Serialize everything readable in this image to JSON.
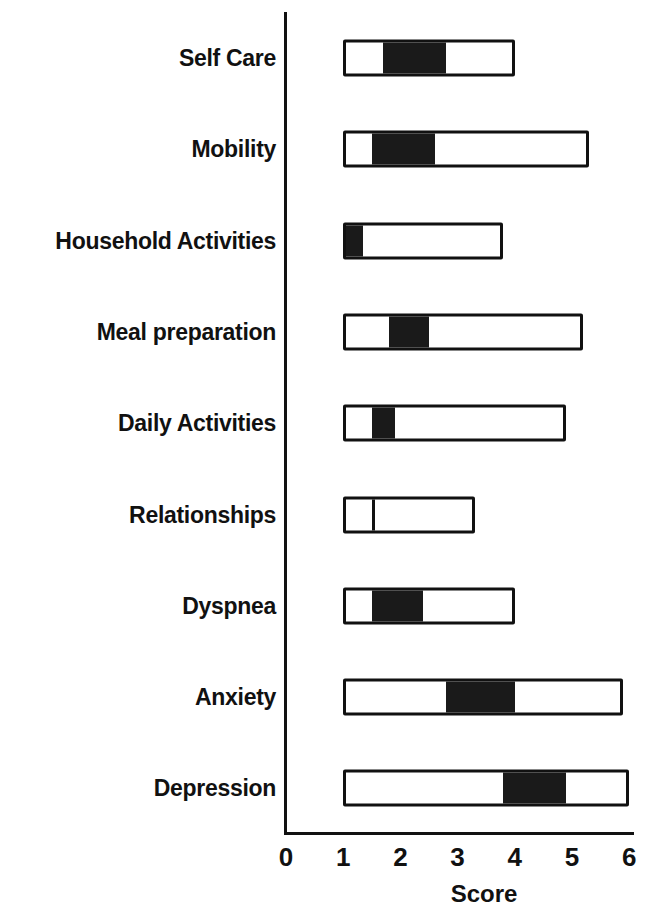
{
  "chart_data": {
    "type": "box",
    "title": "",
    "xlabel": "Score",
    "ylabel": "",
    "xlim": [
      0,
      6
    ],
    "x_ticks": [
      "0",
      "1",
      "2",
      "3",
      "4",
      "5",
      "6"
    ],
    "grid": false,
    "legend": null,
    "orientation": "horizontal",
    "categories": [
      "Self Care",
      "Mobility",
      "Household Activities",
      "Meal preparation",
      "Daily Activities",
      "Relationships",
      "Dyspnea",
      "Anxiety",
      "Depression"
    ],
    "series": [
      {
        "name": "Self Care",
        "min": 1.0,
        "max": 4.0,
        "dark_low": 1.7,
        "dark_high": 2.8
      },
      {
        "name": "Mobility",
        "min": 1.0,
        "max": 5.3,
        "dark_low": 1.5,
        "dark_high": 2.6
      },
      {
        "name": "Household Activities",
        "min": 1.0,
        "max": 3.8,
        "dark_low": 1.0,
        "dark_high": 1.3
      },
      {
        "name": "Meal preparation",
        "min": 1.0,
        "max": 5.2,
        "dark_low": 1.8,
        "dark_high": 2.5
      },
      {
        "name": "Daily Activities",
        "min": 1.0,
        "max": 4.9,
        "dark_low": 1.5,
        "dark_high": 1.9
      },
      {
        "name": "Relationships",
        "min": 1.0,
        "max": 3.3,
        "dark_low": 1.5,
        "dark_high": 1.5
      },
      {
        "name": "Dyspnea",
        "min": 1.0,
        "max": 4.0,
        "dark_low": 1.5,
        "dark_high": 2.4
      },
      {
        "name": "Anxiety",
        "min": 1.0,
        "max": 5.9,
        "dark_low": 2.8,
        "dark_high": 4.0
      },
      {
        "name": "Depression",
        "min": 1.0,
        "max": 6.0,
        "dark_low": 3.8,
        "dark_high": 4.9
      }
    ]
  }
}
